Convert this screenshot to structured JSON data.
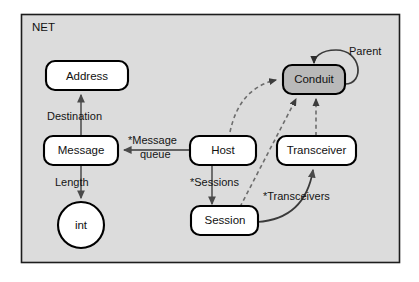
{
  "diagram": {
    "title": "NET",
    "frame": {
      "label": "NET",
      "fill": "#dcdcdc",
      "border": "#1d1d1d"
    },
    "nodes": [
      {
        "id": "address",
        "label": "Address",
        "shape": "rounded-rect",
        "fill": "#ffffff"
      },
      {
        "id": "message",
        "label": "Message",
        "shape": "rounded-rect",
        "fill": "#ffffff"
      },
      {
        "id": "int",
        "label": "int",
        "shape": "circle",
        "fill": "#ffffff"
      },
      {
        "id": "host",
        "label": "Host",
        "shape": "rounded-rect",
        "fill": "#ffffff"
      },
      {
        "id": "session",
        "label": "Session",
        "shape": "rounded-rect",
        "fill": "#ffffff"
      },
      {
        "id": "transceiver",
        "label": "Transceiver",
        "shape": "rounded-rect",
        "fill": "#ffffff"
      },
      {
        "id": "conduit",
        "label": "Conduit",
        "shape": "rounded-rect",
        "fill": "#b9b9b9"
      }
    ],
    "edges": [
      {
        "id": "destination",
        "label": "Destination",
        "from": "message",
        "to": "address",
        "style": "solid",
        "arrow": true
      },
      {
        "id": "length",
        "label": "Length",
        "from": "message",
        "to": "int",
        "style": "solid",
        "arrow": true
      },
      {
        "id": "message-queue",
        "label": "*Message queue",
        "from": "host",
        "to": "message",
        "style": "solid",
        "arrow": true
      },
      {
        "id": "sessions",
        "label": "*Sessions",
        "from": "host",
        "to": "session",
        "style": "solid",
        "arrow": true
      },
      {
        "id": "transceivers",
        "label": "*Transceivers",
        "from": "session",
        "to": "transceiver",
        "style": "solid",
        "arrow": true
      },
      {
        "id": "host-conduit",
        "label": "",
        "from": "host",
        "to": "conduit",
        "style": "dashed",
        "arrow": true
      },
      {
        "id": "session-conduit",
        "label": "",
        "from": "session",
        "to": "conduit",
        "style": "dashed",
        "arrow": true
      },
      {
        "id": "transceiver-conduit",
        "label": "",
        "from": "transceiver",
        "to": "conduit",
        "style": "dashed",
        "arrow": true
      },
      {
        "id": "parent",
        "label": "Parent",
        "from": "conduit",
        "to": "conduit",
        "style": "solid",
        "arrow": true
      }
    ],
    "edge_label_lines": {
      "message_queue_line1": "*Message",
      "message_queue_line2": "queue"
    }
  }
}
